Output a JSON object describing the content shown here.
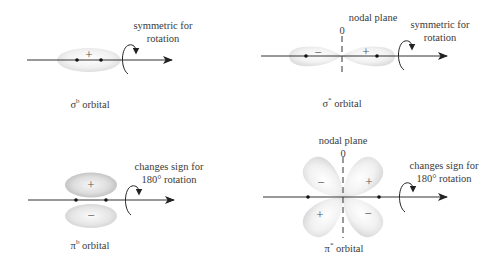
{
  "panels": {
    "sigma_bonding": {
      "caption_symbol": "σ",
      "caption_superscript": "b",
      "caption_text": " orbital",
      "lobe_signs": [
        "+"
      ],
      "annotation_line1": "symmetric for",
      "annotation_line2": "rotation"
    },
    "sigma_antibonding": {
      "caption_symbol": "σ",
      "caption_superscript": "*",
      "caption_text": " orbital",
      "lobe_signs": [
        "−",
        "+"
      ],
      "nodal_label": "nodal plane",
      "nodal_value": "0",
      "annotation_line1": "symmetric for",
      "annotation_line2": "rotation"
    },
    "pi_bonding": {
      "caption_symbol": "π",
      "caption_superscript": "b",
      "caption_text": " orbital",
      "lobe_signs": [
        "+",
        "−"
      ],
      "annotation_line1": "changes sign for",
      "annotation_line2": "180° rotation"
    },
    "pi_antibonding": {
      "caption_symbol": "π",
      "caption_superscript": "*",
      "caption_text": " orbital",
      "lobe_signs": [
        "−",
        "+",
        "+",
        "−"
      ],
      "nodal_label": "nodal plane",
      "nodal_value": "0",
      "annotation_line1": "changes sign for",
      "annotation_line2": "180° rotation"
    }
  },
  "colors": {
    "axis": "#333333",
    "lobe_light": "#f4f4f4",
    "lobe_dark": "#c8c8c8",
    "text": "#3a3a3a"
  }
}
